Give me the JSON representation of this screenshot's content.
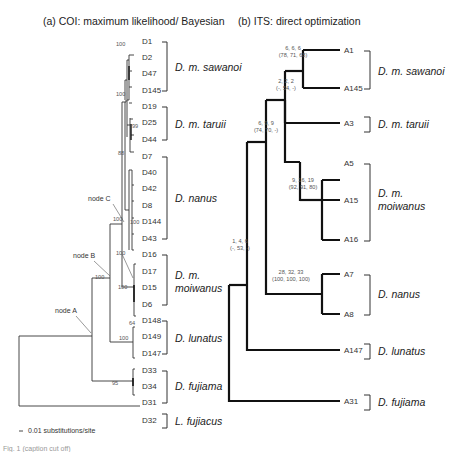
{
  "panel_a": {
    "title": "(a) COI: maximum likelihood/ Bayesian",
    "tips": [
      "D1",
      "D2",
      "D47",
      "D145",
      "D19",
      "D25",
      "D44",
      "D7",
      "D40",
      "D42",
      "D8",
      "D144",
      "D43",
      "D16",
      "D17",
      "D15",
      "D6",
      "D148",
      "D149",
      "D147",
      "D33",
      "D34",
      "D31",
      "D32"
    ],
    "clades": [
      {
        "name": "D. m. sawanoi",
        "lines": [
          "D. m. sawanoi"
        ]
      },
      {
        "name": "D. m. taruii",
        "lines": [
          "D. m. taruii"
        ]
      },
      {
        "name": "D. nanus",
        "lines": [
          "D. nanus"
        ]
      },
      {
        "name": "D. m. moiwanus",
        "lines": [
          "D. m.",
          "moiwanus"
        ]
      },
      {
        "name": "D. lunatus",
        "lines": [
          "D. lunatus"
        ]
      },
      {
        "name": "D. fujiama",
        "lines": [
          "D. fujiama"
        ]
      },
      {
        "name": "L. fujiacus",
        "lines": [
          "L. fujiacus"
        ]
      }
    ],
    "support_values": [
      "100",
      "100",
      "99",
      "88",
      "100",
      "100",
      "100",
      "100",
      "100",
      "64",
      "100",
      "95",
      "100"
    ],
    "node_labels": [
      "node A",
      "node B",
      "node C"
    ],
    "scale_bar": "0.01 substitutions/site"
  },
  "panel_b": {
    "title": "(b) ITS: direct optimization",
    "tips": [
      "A1",
      "A145",
      "A3",
      "A5",
      "A15",
      "A16",
      "A7",
      "A8",
      "A147",
      "A31"
    ],
    "clades": [
      {
        "name": "D. m. sawanoi",
        "lines": [
          "D. m. sawanoi"
        ]
      },
      {
        "name": "D. m. taruii",
        "lines": [
          "D. m. taruii"
        ]
      },
      {
        "name": "D. m. moiwanus",
        "lines": [
          "D. m.",
          "moiwanus"
        ]
      },
      {
        "name": "D. nanus",
        "lines": [
          "D. nanus"
        ]
      },
      {
        "name": "D. lunatus",
        "lines": [
          "D. lunatus"
        ]
      },
      {
        "name": "D. fujiama",
        "lines": [
          "D. fujiama"
        ]
      }
    ],
    "support_values": [
      {
        "bremer": "6, 6, 6",
        "bootstrap": "(78, 71, 68)"
      },
      {
        "bremer": "2, 2, 2",
        "bootstrap": "(-, 54, -)"
      },
      {
        "bremer": "6, 9, 9",
        "bootstrap": "(74, 70, -)"
      },
      {
        "bremer": "9, 16, 19",
        "bootstrap": "(92, 91, 80)"
      },
      {
        "bremer": "28, 32, 33",
        "bootstrap": "(100, 100, 100)"
      },
      {
        "bremer": "1, 4, 6",
        "bootstrap": "(-, 53, -)"
      }
    ]
  },
  "footer": {
    "cut_text": "Fig. 1 (caption cut off)"
  }
}
